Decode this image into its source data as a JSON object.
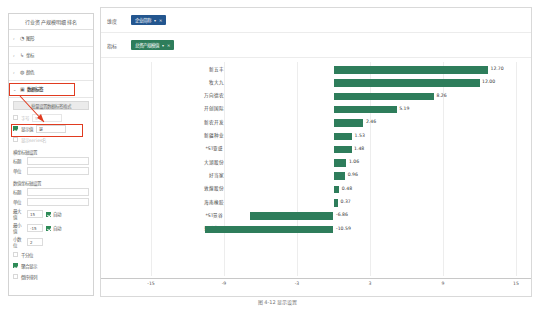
{
  "sidebar": {
    "title": "行业资产规模明细排名",
    "accordions": [
      {
        "label": "图形",
        "icon": "chart-icon",
        "expanded": false,
        "chevron": "›"
      },
      {
        "label": "坐标",
        "icon": "axis-icon",
        "expanded": false,
        "chevron": "›"
      },
      {
        "label": "颜色",
        "icon": "palette-icon",
        "expanded": false,
        "chevron": "›"
      },
      {
        "label": "数据标签",
        "icon": "label-icon",
        "expanded": true,
        "chevron": "⌄"
      }
    ],
    "bulk_button": "批量设置数据标签格式",
    "check_rows": [
      {
        "label": "字号",
        "checked": false,
        "value": "5",
        "enabled": false
      },
      {
        "label": "显示值",
        "checked": true,
        "value": "是",
        "enabled": true
      },
      {
        "label": "显示series名",
        "checked": false,
        "value": "",
        "enabled": false
      }
    ],
    "sections": [
      {
        "head": "横坐标轴设置",
        "fields": [
          {
            "key": "标题",
            "value": ""
          },
          {
            "key": "单位",
            "value": ""
          }
        ]
      },
      {
        "head": "数值坐标轴设置",
        "fields": [
          {
            "key": "标题",
            "value": ""
          },
          {
            "key": "单位",
            "value": ""
          }
        ]
      }
    ],
    "range_rows": [
      {
        "key": "最大值",
        "value": "15",
        "auto_label": "自动",
        "auto_checked": true
      },
      {
        "key": "最小值",
        "value": "-15",
        "auto_label": "自动",
        "auto_checked": true
      }
    ],
    "decimal_row": {
      "key": "小数位",
      "value": "2"
    },
    "bottom_checks": [
      {
        "label": "千分位",
        "checked": false
      },
      {
        "label": "聚合显示",
        "checked": true
      },
      {
        "label": "倒序排列",
        "checked": false
      }
    ]
  },
  "main": {
    "config_rows": [
      {
        "key": "维度",
        "tag": "企业简称",
        "color": "#23568f"
      },
      {
        "key": "指标",
        "tag": "总资产规模值",
        "color": "#2e7d5b"
      }
    ]
  },
  "chart_data": {
    "type": "bar",
    "orientation": "horizontal",
    "title": "",
    "xlabel": "",
    "ylabel": "",
    "xlim": [
      -15,
      15
    ],
    "xticks": [
      -15,
      -9,
      -3,
      3,
      9,
      15
    ],
    "grid": true,
    "series_color": "#2e7d5b",
    "categories": [
      "新五丰",
      "牧大九",
      "万向德农",
      "开创国际",
      "新农开发",
      "新疆种业",
      "*ST亚盛",
      "大湖股份",
      "好当家",
      "敦煌股份",
      "海南橡胶",
      "*ST景谷",
      "亚盛集团"
    ],
    "values": [
      12.7,
      12.0,
      8.26,
      5.19,
      2.46,
      1.53,
      1.48,
      1.06,
      0.96,
      0.48,
      0.37,
      -6.86,
      -10.59
    ],
    "value_labels": [
      "12.70",
      "12.00",
      "8.26",
      "5.19",
      "2.46",
      "1.53",
      "1.48",
      "1.06",
      "0.96",
      "0.48",
      "0.37",
      "-6.86",
      "-10.59"
    ]
  },
  "caption": "图 4-12  显示设置"
}
